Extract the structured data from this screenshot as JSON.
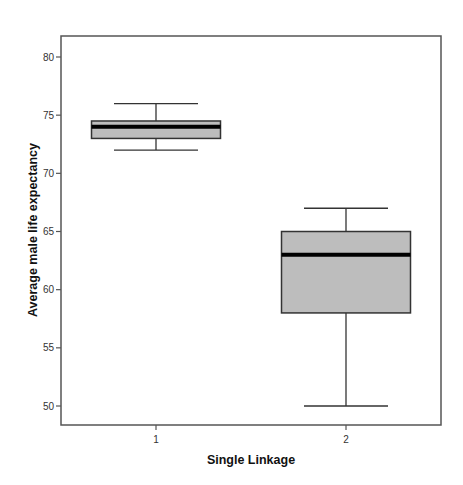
{
  "chart_data": {
    "type": "boxplot",
    "title": "",
    "xlabel": "Single Linkage",
    "ylabel": "Average male life expectancy",
    "categories": [
      "1",
      "2"
    ],
    "ylim": [
      48.3,
      81.9
    ],
    "yticks": [
      50,
      55,
      60,
      65,
      70,
      75,
      80
    ],
    "grid": false,
    "legend": null,
    "series": [
      {
        "name": "1",
        "whisker_low": 72,
        "q1": 73,
        "median": 74,
        "q3": 74.5,
        "whisker_high": 76
      },
      {
        "name": "2",
        "whisker_low": 50,
        "q1": 58,
        "median": 63,
        "q3": 65,
        "whisker_high": 67
      }
    ],
    "colors": {
      "box_fill": "#bdbdbd",
      "median": "#000000",
      "frame": "#555555"
    }
  }
}
